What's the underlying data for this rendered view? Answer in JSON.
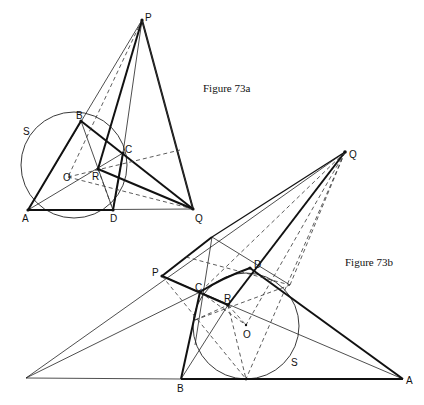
{
  "figures": [
    {
      "id": "73a",
      "caption": "Figure 73a",
      "labels": {
        "P": "P",
        "B": "B",
        "C": "C",
        "R": "R",
        "O": "O",
        "A": "A",
        "D": "D",
        "Q": "Q",
        "S": "S"
      }
    },
    {
      "id": "73b",
      "caption": "Figure 73b",
      "labels": {
        "Q": "Q",
        "P": "P",
        "C": "C",
        "D": "D",
        "R": "R",
        "O": "O",
        "B": "B",
        "A": "A",
        "S": "S"
      }
    }
  ]
}
